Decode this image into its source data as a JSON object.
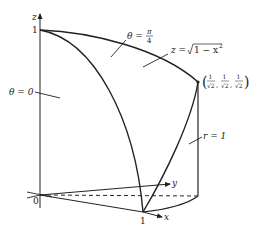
{
  "figure": {
    "type": "3d-region-diagram",
    "colors": {
      "stroke": "#222222",
      "background": "#ffffff"
    },
    "axes": {
      "z_label": "z",
      "y_label": "y",
      "x_label": "x",
      "origin_label": "0",
      "z_tick_label": "1",
      "x_tick_label": "1"
    },
    "labels": {
      "theta_zero": "θ = 0",
      "theta_pi4_prefix": "θ =",
      "theta_pi4_num": "π",
      "theta_pi4_den": "4",
      "surface_prefix": "z =",
      "surface_expr": "1 − x",
      "surface_exp": "2",
      "cylinder": "r = 1",
      "point_open": "(",
      "point_close": ")",
      "point_num": "1",
      "point_den": "√2",
      "point_sep": ","
    }
  }
}
